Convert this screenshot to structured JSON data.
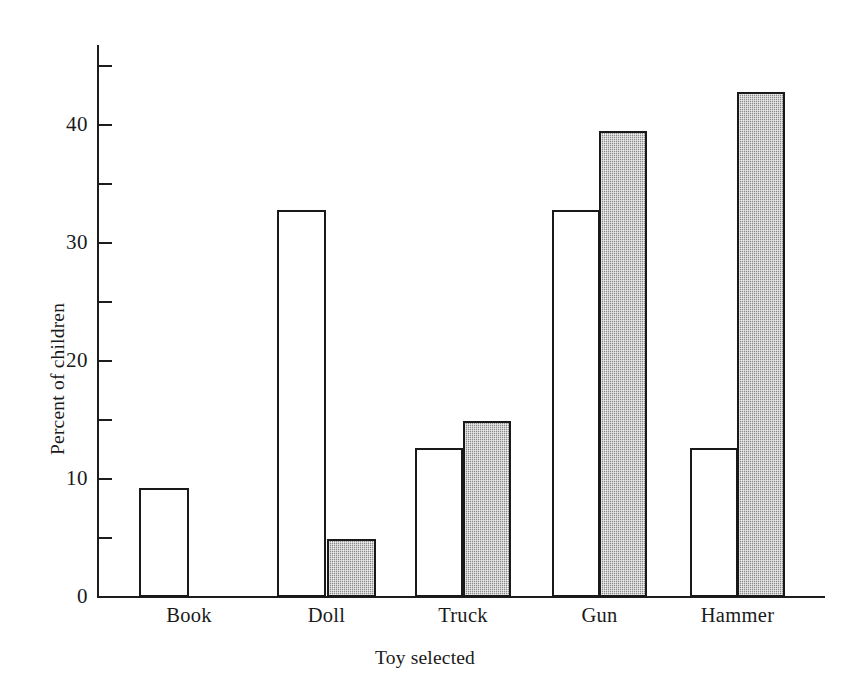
{
  "figure": {
    "background_color": "#ffffff",
    "ink_color": "#191919",
    "shaded_fill_color": "#a9a9a9",
    "open_fill_color": "#ffffff"
  },
  "chart_data": {
    "type": "bar",
    "title": "",
    "xlabel": "Toy selected",
    "ylabel": "Percent of children",
    "categories": [
      "Book",
      "Doll",
      "Truck",
      "Gun",
      "Hammer"
    ],
    "series": [
      {
        "name": "open",
        "fill": "white",
        "values": [
          9.2,
          32.8,
          12.6,
          32.8,
          12.6
        ]
      },
      {
        "name": "shaded",
        "fill": "gray",
        "values": [
          0,
          4.9,
          14.9,
          39.5,
          42.8
        ]
      }
    ],
    "ylim": [
      0,
      46
    ],
    "ytick_major": [
      0,
      10,
      20,
      30,
      40
    ],
    "ytick_major_labels": [
      "0",
      "10",
      "20",
      "30",
      "40"
    ],
    "ytick_minor": [
      5,
      15,
      25,
      35,
      45
    ],
    "grid": false,
    "legend": "none"
  }
}
